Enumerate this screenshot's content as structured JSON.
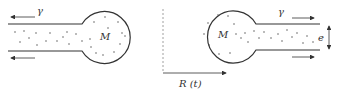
{
  "diagram": {
    "left_panel": {
      "mass_label": "M",
      "tension_label": "γ",
      "flow_direction": "left"
    },
    "right_panel": {
      "mass_label": "M",
      "tension_label": "γ",
      "thickness_label": "e",
      "flow_direction": "right"
    },
    "axis": {
      "label": "R (t)"
    },
    "colors": {
      "stroke": "#333333",
      "dashed": "#888888",
      "dots": "#444444"
    }
  }
}
